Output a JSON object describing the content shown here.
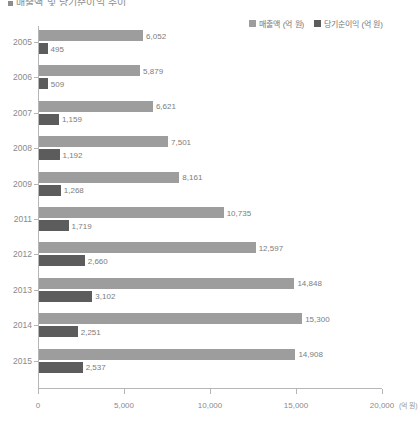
{
  "title": {
    "text": "매출액 및 당기순이익 추이",
    "bullet_icon": "square-bullet-icon"
  },
  "legend": {
    "position": "top-right",
    "items": [
      {
        "label": "매출액 (억 원)",
        "color": "#9d9d9d",
        "icon": "legend-swatch-icon"
      },
      {
        "label": "당기순이익 (억 원)",
        "color": "#5c5c5c",
        "icon": "legend-swatch-icon"
      }
    ]
  },
  "axis": {
    "x_unit": "(억 원)",
    "x_ticks": [
      "0",
      "5,000",
      "10,000",
      "15,000",
      "20,000"
    ]
  },
  "chart_data": {
    "type": "bar",
    "orientation": "horizontal",
    "title": "매출액 및 당기순이익 추이",
    "xlabel": "(억 원)",
    "ylabel": "",
    "xlim": [
      0,
      20000
    ],
    "xticks": [
      0,
      5000,
      10000,
      15000,
      20000
    ],
    "grid": false,
    "legend_position": "top-right",
    "categories": [
      "2005",
      "2006",
      "2007",
      "2008",
      "2009",
      "2011",
      "2012",
      "2013",
      "2014",
      "2015"
    ],
    "series": [
      {
        "name": "매출액 (억 원)",
        "color": "#9d9d9d",
        "values": [
          6052,
          5879,
          6621,
          7501,
          8161,
          10735,
          12597,
          14848,
          15300,
          14908
        ],
        "labels": [
          "6,052",
          "5,879",
          "6,621",
          "7,501",
          "8,161",
          "10,735",
          "12,597",
          "14,848",
          "15,300",
          "14,908"
        ]
      },
      {
        "name": "당기순이익 (억 원)",
        "color": "#5c5c5c",
        "values": [
          495,
          509,
          1159,
          1192,
          1268,
          1719,
          2660,
          3102,
          2251,
          2537
        ],
        "labels": [
          "495",
          "509",
          "1,159",
          "1,192",
          "1,268",
          "1,719",
          "2,660",
          "3,102",
          "2,251",
          "2,537"
        ]
      }
    ]
  }
}
